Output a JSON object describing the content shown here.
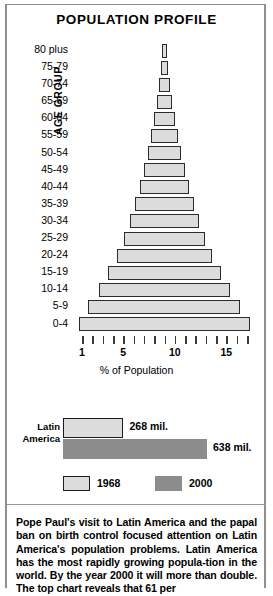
{
  "chart_data": {
    "type": "bar",
    "title": "POPULATION PROFILE",
    "orientation": "horizontal",
    "xlabel": "% of Population",
    "ylabel": "AGE GROUP",
    "xlim": [
      0.5,
      17.5
    ],
    "xticks": [
      1,
      2,
      3,
      4,
      5,
      6,
      7,
      8,
      9,
      10,
      11,
      12,
      13,
      14,
      15,
      16,
      17
    ],
    "xtick_labels": [
      {
        "value": 1,
        "label": "1"
      },
      {
        "value": 5,
        "label": "5"
      },
      {
        "value": 10,
        "label": "10"
      },
      {
        "value": 15,
        "label": "15"
      }
    ],
    "grid": false,
    "legend_position": "bottom",
    "categories": [
      "80 plus",
      "75-79",
      "70-74",
      "65-69",
      "60-64",
      "55-59",
      "50-54",
      "45-49",
      "40-44",
      "35-39",
      "30-34",
      "25-29",
      "20-24",
      "15-19",
      "10-14",
      "5-9",
      "0-4"
    ],
    "values": [
      0.5,
      0.7,
      1.0,
      1.4,
      2.0,
      2.6,
      3.2,
      4.0,
      4.8,
      5.6,
      6.6,
      7.8,
      9.2,
      10.8,
      12.6,
      14.6,
      16.5
    ]
  },
  "comparison_chart": {
    "type": "bar",
    "region_label": "Latin\nAmerica",
    "region_label_line1": "Latin",
    "region_label_line2": "America",
    "bars": [
      {
        "series": "1968",
        "value": 268,
        "label": "268 mil."
      },
      {
        "series": "2000",
        "value": 638,
        "label": "638 mil."
      }
    ],
    "legend": [
      {
        "label": "1968",
        "color": "#dcdcdc"
      },
      {
        "label": "2000",
        "color": "#8c8c8c"
      }
    ]
  },
  "colors": {
    "bar_light": "#dcdcdc",
    "bar_dark": "#8c8c8c",
    "outline": "#2b2b2b",
    "frame": "#8f8f8f"
  },
  "caption": {
    "text": "Pope Paul's visit to Latin America and the papal ban on birth control focused attention on Latin America's population problems. Latin America has the most rapidly growing popula-tion in the world. By the year 2000 it will more than double. The top chart reveals that 61 per"
  }
}
